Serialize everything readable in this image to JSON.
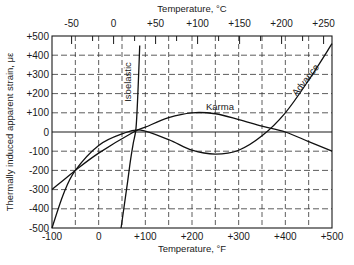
{
  "chart_data": {
    "type": "line",
    "title": "",
    "xlabel": "Temperature, °F",
    "x2label": "Temperature, °C",
    "ylabel": "Thermally induced apparent strain, με",
    "xlim": [
      -100,
      500
    ],
    "ylim": [
      -500,
      500
    ],
    "grid": true,
    "x_ticks": [
      "-100",
      "0",
      "+100",
      "+200",
      "+300",
      "+400",
      "+500"
    ],
    "x2_ticks": [
      "-50",
      "0",
      "+50",
      "+100",
      "+150",
      "+200",
      "+250"
    ],
    "y_ticks": [
      "+500",
      "+400",
      "+300",
      "+200",
      "+100",
      "0",
      "-100",
      "-200",
      "-300",
      "-400",
      "-500"
    ],
    "series": [
      {
        "name": "Isoelastic",
        "x": [
          48,
          55,
          62,
          68,
          74,
          80,
          84,
          88
        ],
        "y": [
          -500,
          -380,
          -260,
          -150,
          -60,
          20,
          200,
          450
        ]
      },
      {
        "name": "Karma",
        "x": [
          -100,
          -50,
          0,
          75,
          100,
          150,
          200,
          250,
          300,
          350,
          400,
          450,
          500
        ],
        "y": [
          -300,
          -200,
          -110,
          0,
          25,
          75,
          100,
          95,
          65,
          30,
          0,
          -50,
          -100
        ]
      },
      {
        "name": "Advance",
        "x": [
          -100,
          -75,
          -50,
          0,
          50,
          90,
          150,
          200,
          250,
          300,
          350,
          400,
          450,
          500
        ],
        "y": [
          -500,
          -320,
          -200,
          -70,
          -10,
          10,
          -40,
          -95,
          -115,
          -95,
          -20,
          100,
          270,
          460
        ]
      }
    ]
  }
}
